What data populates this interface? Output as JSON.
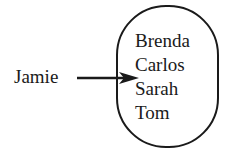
{
  "diagram": {
    "type": "set-membership",
    "pointer": {
      "label": "Jamie",
      "arrow_icon": "right-arrow"
    },
    "container": {
      "shape": "rounded-oval",
      "items": [
        {
          "label": "Brenda"
        },
        {
          "label": "Carlos"
        },
        {
          "label": "Sarah"
        },
        {
          "label": "Tom"
        }
      ]
    },
    "colors": {
      "stroke": "#1a1a1a",
      "background": "#ffffff"
    }
  }
}
